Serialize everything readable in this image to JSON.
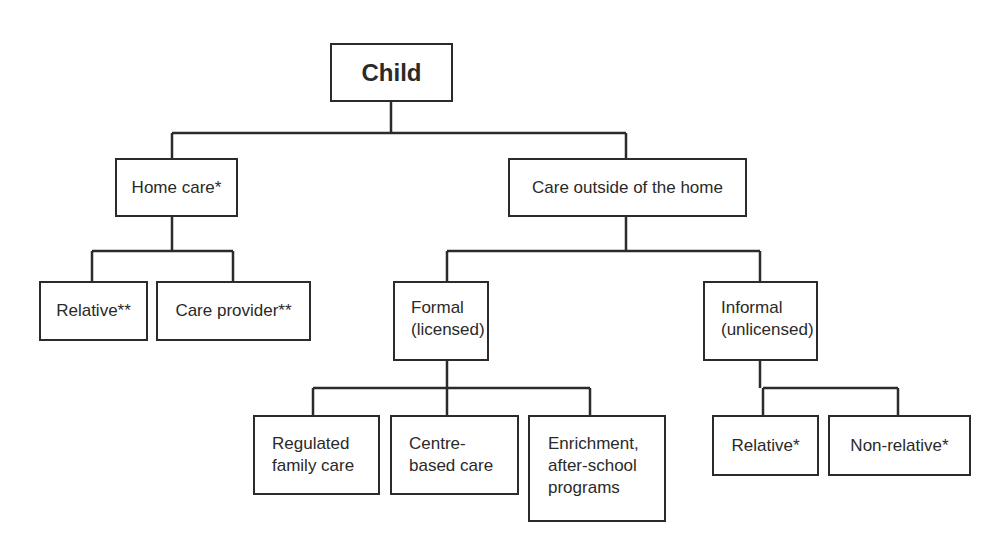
{
  "diagram": {
    "root": "Child",
    "level1": {
      "home_care": "Home care*",
      "outside": "Care outside of the home"
    },
    "home_care_children": {
      "relative": "Relative**",
      "care_provider": "Care provider**"
    },
    "outside_children": {
      "formal": "Formal\n(licensed)",
      "informal": "Informal\n(unlicensed)"
    },
    "formal_children": {
      "regulated": "Regulated\nfamily care",
      "centre": "Centre-\nbased care",
      "enrichment": "Enrichment,\nafter-school\nprograms"
    },
    "informal_children": {
      "relative": "Relative*",
      "non_relative": "Non-relative*"
    },
    "colors": {
      "line": "#2b2b2b",
      "text": "#2a2a2a",
      "background": "#ffffff"
    }
  }
}
